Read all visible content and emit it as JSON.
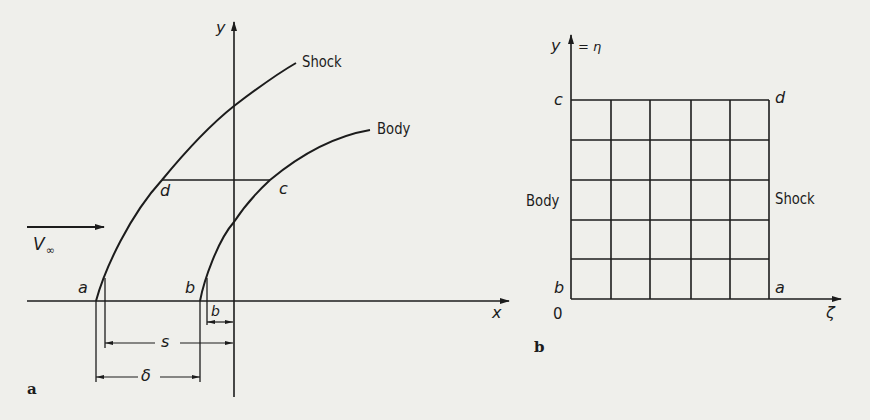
{
  "figure": {
    "panel_a": {
      "panel_label": "a",
      "axis_x_label": "x",
      "axis_y_label": "y",
      "curves": {
        "shock_label": "Shock",
        "body_label": "Body"
      },
      "points": {
        "a": "a",
        "b": "b",
        "c": "c",
        "d": "d"
      },
      "freestream": {
        "symbol": "V",
        "subscript": "∞"
      },
      "dimensions": {
        "s": "s",
        "delta": "δ",
        "b": "b"
      }
    },
    "panel_b": {
      "panel_label": "b",
      "axis_y_label": "y",
      "axis_y_eq": "= η",
      "axis_x_label": "ζ",
      "origin_label": "0",
      "corners": {
        "c": "c",
        "d": "d",
        "b": "b",
        "a": "a"
      },
      "side_left_label": "Body",
      "side_right_label": "Shock",
      "grid": {
        "columns": 5,
        "rows": 5
      }
    },
    "colors": {
      "ink": "#1c1c1c",
      "paper": "#efefeb"
    }
  }
}
